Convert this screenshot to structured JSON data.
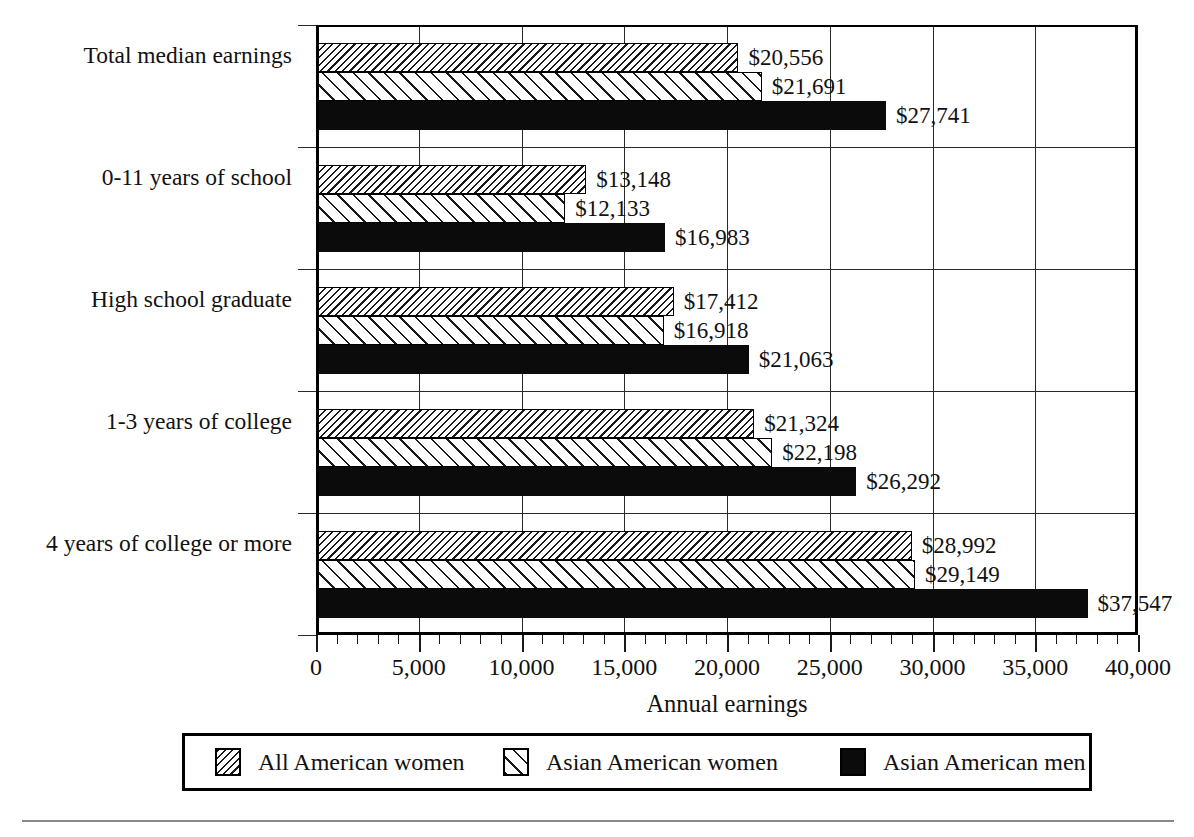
{
  "chart_data": {
    "type": "bar",
    "orientation": "horizontal",
    "title": "",
    "xlabel": "Annual earnings",
    "ylabel": "",
    "xlim": [
      0,
      40000
    ],
    "xticks": [
      0,
      5000,
      10000,
      15000,
      20000,
      25000,
      30000,
      35000,
      40000
    ],
    "xticklabels": [
      "0",
      "5,000",
      "10,000",
      "15,000",
      "20,000",
      "25,000",
      "30,000",
      "35,000",
      "40,000"
    ],
    "minor_tick_interval": 1000,
    "grid": "vertical gridlines at major ticks; horizontal separators between category groups",
    "legend_position": "below plot, inside bordered box",
    "categories": [
      "Total median earnings",
      "0-11 years of school",
      "High school graduate",
      "1-3 years of college",
      "4 years of college or more"
    ],
    "series": [
      {
        "name": "All American women",
        "pattern": "dense-diagonal-hatch",
        "values": [
          20556,
          13148,
          17412,
          21324,
          28992
        ],
        "labels": [
          "$20,556",
          "$13,148",
          "$17,412",
          "$21,324",
          "$28,992"
        ]
      },
      {
        "name": "Asian American women",
        "pattern": "sparse-diagonal-hatch",
        "values": [
          21691,
          12133,
          16918,
          22198,
          29149
        ],
        "labels": [
          "$21,691",
          "$12,133",
          "$16,918",
          "$22,198",
          "$29,149"
        ]
      },
      {
        "name": "Asian American men",
        "pattern": "solid-black",
        "values": [
          27741,
          16983,
          21063,
          26292,
          37547
        ],
        "labels": [
          "$27,741",
          "$16,983",
          "$21,063",
          "$26,292",
          "$37,547"
        ]
      }
    ]
  },
  "colors": {
    "axis": "#000000",
    "grid": "#2a2a2a",
    "text": "#111111",
    "solid_series": "#0b0b0b",
    "background": "#ffffff",
    "footer_rule": "#888888"
  }
}
